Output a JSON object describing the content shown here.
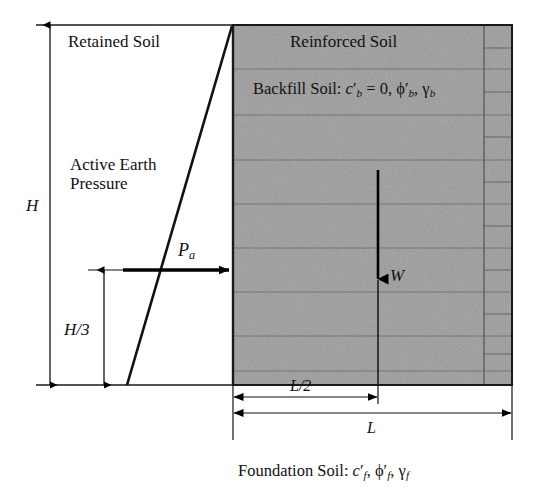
{
  "diagram": {
    "zones": {
      "retained_soil_label": "Retained Soil",
      "reinforced_soil_label": "Reinforced Soil",
      "active_earth_pressure_label_line1": "Active Earth",
      "active_earth_pressure_label_line2": "Pressure"
    },
    "annotations": {
      "wall_height": "H",
      "resultant_height": "H/3",
      "active_thrust": "P",
      "active_thrust_sub": "a",
      "weight": "W",
      "half_length": "L/2",
      "length": "L"
    },
    "backfill": {
      "prefix": "Backfill Soil: ",
      "cohesion_symbol": "c",
      "cohesion_prime": "′",
      "cohesion_sub": "b",
      "cohesion_value": " = 0, ",
      "friction_symbol": "ϕ",
      "friction_prime": "′",
      "friction_sub": "b",
      "separator": ", ",
      "unit_weight_symbol": "γ",
      "unit_weight_sub": "b"
    },
    "foundation": {
      "prefix": "Foundation Soil: ",
      "cohesion_symbol": "c",
      "cohesion_prime": "′",
      "cohesion_sub": "f",
      "separator1": ", ",
      "friction_symbol": "ϕ",
      "friction_prime": "′",
      "friction_sub": "f",
      "separator2": ", ",
      "unit_weight_symbol": "γ",
      "unit_weight_sub": "f"
    },
    "colors": {
      "reinforced_fill": "#9b9b9b",
      "line": "#000000",
      "block_line": "#6f6f6f",
      "background": "#ffffff"
    },
    "geometry": {
      "top_y": 25,
      "base_y": 385,
      "wall_face_x": 233,
      "reinforced_right_x": 512,
      "facing_divider_x": 484,
      "wedge_base_x": 127,
      "pa_line_y": 270,
      "w_arrow_x": 378,
      "h_dim_x": 50,
      "h3_dim_x": 104,
      "l2_dim_y": 397,
      "l_dim_y": 413
    }
  }
}
